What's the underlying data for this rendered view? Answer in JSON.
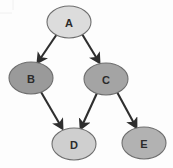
{
  "diagram": {
    "width": 173,
    "height": 168,
    "background_color": "#fdfdfd",
    "edge_color": "#2e2e2e",
    "node_border_color": "#6e6e6e",
    "label_color": "#2b2b2b",
    "nodes": [
      {
        "id": "A",
        "label": "A",
        "cx": 69,
        "cy": 22,
        "rx": 22,
        "ry": 16,
        "fill": "#dcdcdc"
      },
      {
        "id": "B",
        "label": "B",
        "cx": 31,
        "cy": 78,
        "rx": 22,
        "ry": 16,
        "fill": "#9a9a9a"
      },
      {
        "id": "C",
        "label": "C",
        "cx": 106,
        "cy": 79,
        "rx": 22,
        "ry": 16,
        "fill": "#a4a4a4"
      },
      {
        "id": "D",
        "label": "D",
        "cx": 74,
        "cy": 144,
        "rx": 22,
        "ry": 16,
        "fill": "#cfcfcf"
      },
      {
        "id": "E",
        "label": "E",
        "cx": 144,
        "cy": 143,
        "rx": 22,
        "ry": 16,
        "fill": "#b2b2b2"
      }
    ],
    "edges": [
      {
        "id": "A-B",
        "from": "A",
        "to": "B",
        "x1": 57,
        "y1": 34,
        "x2": 38,
        "y2": 62
      },
      {
        "id": "A-C",
        "from": "A",
        "to": "C",
        "x1": 82,
        "y1": 34,
        "x2": 99,
        "y2": 62
      },
      {
        "id": "B-D",
        "from": "B",
        "to": "D",
        "x1": 41,
        "y1": 92,
        "x2": 62,
        "y2": 128
      },
      {
        "id": "C-D",
        "from": "C",
        "to": "D",
        "x1": 97,
        "y1": 93,
        "x2": 81,
        "y2": 128
      },
      {
        "id": "C-E",
        "from": "C",
        "to": "E",
        "x1": 117,
        "y1": 92,
        "x2": 136,
        "y2": 127
      }
    ]
  }
}
